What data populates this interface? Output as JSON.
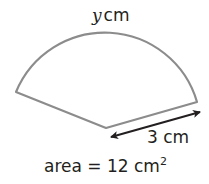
{
  "diagram": {
    "type": "sector",
    "arc_label": {
      "variable": "y",
      "unit": "cm"
    },
    "radius_label": "3 cm",
    "area_label": {
      "prefix": "area = 12 cm",
      "exponent": "2"
    },
    "colors": {
      "outline": "#8c8c8c",
      "arrow": "#231f20",
      "text": "#231f20"
    }
  }
}
